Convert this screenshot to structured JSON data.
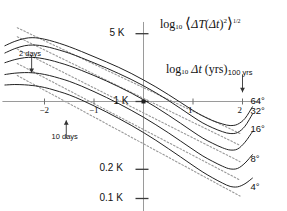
{
  "chart_data": {
    "type": "line",
    "title": "",
    "xlabel": "log10 Δt (yrs)",
    "ylabel": "log10 ⟨ΔT(Δt)²⟩^1/2",
    "xlim": [
      -2.85,
      2.35
    ],
    "ylim": [
      -1.15,
      0.82
    ],
    "grid": false,
    "legend_position": "right-inline",
    "xticks": [
      -2,
      -1,
      1,
      2
    ],
    "xtick_labels": [
      "−2",
      "−1",
      "1",
      "2"
    ],
    "yticks": [
      0.699,
      0,
      -0.699,
      -1
    ],
    "ytick_labels": [
      "5 K",
      "1 K",
      "0.2 K",
      "0.1 K"
    ],
    "annotations": [
      {
        "name": "two-days",
        "text": "2 days",
        "x": -2.26,
        "y_text": 0.48,
        "arrow": "down",
        "points_to_x": -2.26
      },
      {
        "name": "ten-days",
        "text": "10 days",
        "x": -1.56,
        "y_text": -0.38,
        "arrow": "up",
        "points_to_x": -1.56
      },
      {
        "name": "hundred-yrs",
        "text": "100 yrs",
        "x": 2.0,
        "y_text": 0.28,
        "arrow": "down",
        "points_to_x": 2.0
      }
    ],
    "series": [
      {
        "name": "64°",
        "label": "64°",
        "color": "#222222",
        "label_x": 2.16,
        "label_y": 0.0,
        "x": [
          -2.8,
          -2.6,
          -2.4,
          -2.25,
          -2.1,
          -1.9,
          -1.7,
          -1.5,
          -1.25,
          -1.0,
          -0.75,
          -0.5,
          -0.25,
          0.0,
          0.25,
          0.5,
          0.75,
          1.0,
          1.2,
          1.4,
          1.6,
          1.75,
          1.9,
          2.05,
          2.2
        ],
        "y": [
          0.575,
          0.62,
          0.65,
          0.658,
          0.652,
          0.63,
          0.6,
          0.565,
          0.515,
          0.462,
          0.408,
          0.352,
          0.29,
          0.222,
          0.15,
          0.072,
          -0.01,
          -0.092,
          -0.15,
          -0.198,
          -0.232,
          -0.248,
          -0.235,
          -0.175,
          -0.055
        ]
      },
      {
        "name": "32°",
        "label": "32°",
        "color": "#222222",
        "label_x": 2.16,
        "label_y": -0.105,
        "x": [
          -2.8,
          -2.6,
          -2.4,
          -2.25,
          -2.1,
          -1.9,
          -1.7,
          -1.5,
          -1.25,
          -1.0,
          -0.75,
          -0.5,
          -0.25,
          0.0,
          0.25,
          0.5,
          0.75,
          1.0,
          1.2,
          1.4,
          1.6,
          1.75,
          1.9,
          2.05,
          2.2
        ],
        "y": [
          0.5,
          0.545,
          0.575,
          0.582,
          0.578,
          0.558,
          0.53,
          0.498,
          0.45,
          0.398,
          0.345,
          0.288,
          0.228,
          0.162,
          0.09,
          0.012,
          -0.072,
          -0.158,
          -0.222,
          -0.272,
          -0.312,
          -0.33,
          -0.32,
          -0.255,
          -0.13
        ]
      },
      {
        "name": "16°",
        "label": "16°",
        "color": "#222222",
        "label_x": 2.16,
        "label_y": -0.295,
        "x": [
          -2.8,
          -2.6,
          -2.4,
          -2.25,
          -2.1,
          -1.9,
          -1.7,
          -1.5,
          -1.25,
          -1.0,
          -0.75,
          -0.5,
          -0.25,
          0.0,
          0.25,
          0.5,
          0.75,
          1.0,
          1.2,
          1.4,
          1.6,
          1.75,
          1.9,
          2.05,
          2.2
        ],
        "y": [
          0.4,
          0.432,
          0.452,
          0.455,
          0.448,
          0.428,
          0.4,
          0.368,
          0.32,
          0.268,
          0.212,
          0.152,
          0.088,
          0.018,
          -0.058,
          -0.14,
          -0.225,
          -0.312,
          -0.378,
          -0.432,
          -0.478,
          -0.5,
          -0.49,
          -0.42,
          -0.312
        ]
      },
      {
        "name": "8°",
        "label": "8°",
        "color": "#222222",
        "label_x": 2.16,
        "label_y": -0.6,
        "x": [
          -2.8,
          -2.6,
          -2.4,
          -2.25,
          -2.1,
          -1.9,
          -1.7,
          -1.5,
          -1.25,
          -1.0,
          -0.75,
          -0.5,
          -0.25,
          0.0,
          0.25,
          0.5,
          0.75,
          1.0,
          1.2,
          1.4,
          1.6,
          1.75,
          1.9,
          2.05,
          2.2
        ],
        "y": [
          0.278,
          0.292,
          0.298,
          0.296,
          0.288,
          0.268,
          0.24,
          0.208,
          0.158,
          0.102,
          0.042,
          -0.022,
          -0.09,
          -0.162,
          -0.24,
          -0.322,
          -0.408,
          -0.495,
          -0.562,
          -0.618,
          -0.668,
          -0.695,
          -0.69,
          -0.635,
          -0.548
        ]
      },
      {
        "name": "4°",
        "label": "4°",
        "color": "#222222",
        "label_x": 2.16,
        "label_y": -0.895,
        "x": [
          -2.8,
          -2.6,
          -2.4,
          -2.25,
          -2.1,
          -1.9,
          -1.7,
          -1.5,
          -1.25,
          -1.0,
          -0.75,
          -0.5,
          -0.25,
          0.0,
          0.25,
          0.5,
          0.75,
          1.0,
          1.2,
          1.4,
          1.6,
          1.75,
          1.9,
          2.05,
          2.2
        ],
        "y": [
          0.17,
          0.175,
          0.172,
          0.165,
          0.155,
          0.132,
          0.102,
          0.068,
          0.015,
          -0.045,
          -0.108,
          -0.175,
          -0.245,
          -0.32,
          -0.4,
          -0.485,
          -0.572,
          -0.66,
          -0.728,
          -0.788,
          -0.842,
          -0.875,
          -0.88,
          -0.848,
          -0.79
        ]
      }
    ],
    "reference_lines": [
      {
        "name": "ref-64",
        "style": "dotted",
        "color": "#999999",
        "x0": -2.55,
        "y0": 0.76,
        "x1": 1.95,
        "y1": -0.33
      },
      {
        "name": "ref-32",
        "style": "dotted",
        "color": "#999999",
        "x0": -2.55,
        "y0": 0.668,
        "x1": 1.95,
        "y1": -0.452
      },
      {
        "name": "ref-16",
        "style": "dotted",
        "color": "#999999",
        "x0": -2.55,
        "y0": 0.54,
        "x1": 1.95,
        "y1": -0.62
      },
      {
        "name": "ref-8",
        "style": "dotted",
        "color": "#999999",
        "x0": -2.55,
        "y0": 0.392,
        "x1": 1.95,
        "y1": -0.81
      },
      {
        "name": "ref-4",
        "style": "dotted",
        "color": "#999999",
        "x0": -2.55,
        "y0": 0.268,
        "x1": 1.95,
        "y1": -0.975
      }
    ]
  },
  "axis_titles": {
    "y_parts": {
      "log": "log",
      "sub": "10",
      "open": "⟨",
      "dT": "ΔT",
      "open2": "(",
      "dt": "Δt",
      "close2": ")",
      "sq": "2",
      "close": "⟩",
      "exp": "1/2"
    },
    "x_parts": {
      "log": "log",
      "sub": "10",
      "dt": "Δt",
      "unit": "(yrs)"
    }
  }
}
